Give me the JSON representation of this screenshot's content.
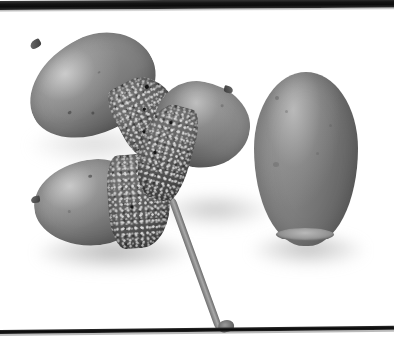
{
  "photo": {
    "caption": "Black and white photograph of four acorns: three attached to a single stem on the left, each seated in a scaly cup, and one bare acorn nut on the right.",
    "subject": "acorns",
    "color_mode": "grayscale",
    "background_color": "#ffffff",
    "frame": {
      "top_band_color": "#0c0c0c",
      "bottom_band_color": "#0a0a0a",
      "top_band_label": "top-dark-band",
      "bottom_band_label": "bottom-dark-line"
    },
    "objects": [
      {
        "id": "acorn-upper-left",
        "label": "upper left acorn",
        "nut_color": "#8b8b8b",
        "cup_color": "#5a5a5a",
        "orientation": "tip points up-left",
        "has_cup": true
      },
      {
        "id": "acorn-lower-left",
        "label": "lower left acorn",
        "nut_color": "#8e8e8e",
        "cup_color": "#5e5e5e",
        "orientation": "tip points left",
        "has_cup": true
      },
      {
        "id": "acorn-middle",
        "label": "middle acorn",
        "nut_color": "#898989",
        "cup_color": "#585858",
        "orientation": "tip points right",
        "has_cup": true
      },
      {
        "id": "acorn-right",
        "label": "right bare acorn nut",
        "nut_color": "#7e7e7e",
        "cup_color": "",
        "orientation": "upright, basal scar at bottom",
        "has_cup": false
      }
    ],
    "stem": {
      "label": "stem",
      "color": "#8f8f8f",
      "direction": "runs from the acorn cluster down to the lower right"
    },
    "shadows": {
      "label": "cast shadows",
      "color": "#b4b4b4"
    }
  }
}
